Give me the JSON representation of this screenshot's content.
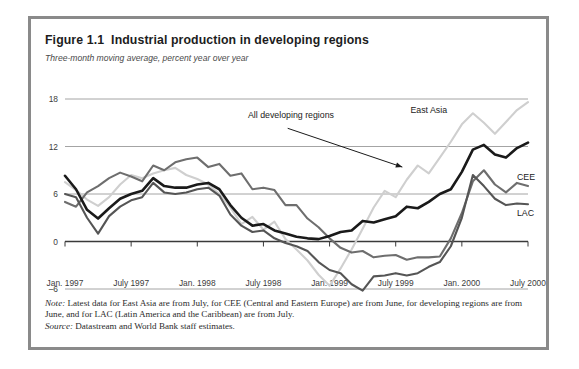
{
  "figure": {
    "title": "Figure 1.1  Industrial production in developing regions",
    "subtitle": "Three-month moving average, percent year over year",
    "note_label": "Note:",
    "note_text": " Latest data for East Asia are from July, for CEE (Central and Eastern Europe) are from June, for developing regions are from June, and for LAC (Latin America and the Caribbean) are from July.",
    "source_label": "Source:",
    "source_text": " Datastream and World Bank staff estimates."
  },
  "colors": {
    "frame": "#8a8a8a",
    "zero_axis": "#3a3a3a",
    "gridline": "#9a9a9a",
    "all_developing": "#1a1a1a",
    "east_asia": "#cfcfcf",
    "cee": "#6e6e6e",
    "lac": "#555555",
    "leader": "#1a1a1a"
  },
  "chart_data": {
    "type": "line",
    "title": "Industrial production in developing regions",
    "subtitle": "Three-month moving average, percent year over year",
    "xlabel": "",
    "ylabel": "percent year over year",
    "ylim": [
      -6,
      18
    ],
    "yticks": [
      -6,
      0,
      6,
      12,
      18
    ],
    "ytick_labels": [
      "–6",
      "0",
      "6",
      "12",
      "18"
    ],
    "xlim": [
      0,
      42
    ],
    "xticks": [
      0,
      6,
      12,
      18,
      24,
      30,
      36,
      42
    ],
    "xtick_labels": [
      "Jan. 1997",
      "July 1997",
      "Jan. 1998",
      "July 1998",
      "Jan. 1999",
      "July 1999",
      "Jan. 2000",
      "July 2000"
    ],
    "grid": true,
    "legend": "inline-annotations",
    "x": [
      0,
      1,
      2,
      3,
      4,
      5,
      6,
      7,
      8,
      9,
      10,
      11,
      12,
      13,
      14,
      15,
      16,
      17,
      18,
      19,
      20,
      21,
      22,
      23,
      24,
      25,
      26,
      27,
      28,
      29,
      30,
      31,
      32,
      33,
      34,
      35,
      36,
      37,
      38,
      39,
      40,
      41,
      42
    ],
    "series": [
      {
        "name": "East Asia",
        "color": "#cfcfcf",
        "width": 2.1,
        "label_x": 33,
        "label_y": 16.2,
        "values": [
          7.5,
          6.5,
          5.3,
          4.5,
          5.6,
          7.2,
          8.4,
          8.0,
          8.6,
          9.0,
          9.3,
          8.4,
          7.9,
          7.2,
          6.0,
          4.3,
          2.2,
          3.1,
          1.5,
          2.5,
          0.3,
          -1.0,
          -2.4,
          -4.2,
          -5.6,
          -3.4,
          -1.0,
          1.6,
          4.3,
          6.4,
          5.6,
          7.8,
          9.6,
          8.6,
          10.6,
          12.6,
          14.8,
          16.2,
          15.0,
          13.6,
          15.1,
          16.6,
          17.6
        ]
      },
      {
        "name": "All developing regions",
        "color": "#1a1a1a",
        "width": 2.6,
        "label_x": 20.5,
        "label_y": 15.6,
        "values": [
          8.3,
          6.6,
          4.0,
          2.9,
          4.2,
          5.4,
          6.0,
          6.4,
          8.0,
          7.0,
          6.8,
          6.8,
          7.2,
          7.4,
          6.6,
          4.6,
          3.0,
          2.0,
          2.2,
          1.4,
          1.0,
          0.6,
          0.4,
          0.3,
          0.7,
          1.2,
          1.4,
          2.6,
          2.4,
          2.8,
          3.2,
          4.4,
          4.2,
          5.0,
          6.0,
          6.6,
          8.8,
          11.6,
          12.2,
          11.0,
          10.6,
          11.8,
          12.5
        ]
      },
      {
        "name": "CEE",
        "color": "#6e6e6e",
        "width": 2.1,
        "label_x": 41,
        "label_y": 7.8,
        "values": [
          5.0,
          4.4,
          6.2,
          7.0,
          8.0,
          8.7,
          8.2,
          7.6,
          9.6,
          9.0,
          10.0,
          10.4,
          10.6,
          9.4,
          9.8,
          8.3,
          8.6,
          6.6,
          6.8,
          6.5,
          4.6,
          4.6,
          2.9,
          1.8,
          0.4,
          -0.8,
          -1.4,
          -1.2,
          -2.0,
          -1.8,
          -1.7,
          -2.3,
          -2.0,
          -2.0,
          -1.9,
          0.4,
          3.6,
          7.6,
          9.0,
          7.2,
          6.2,
          7.4,
          7.0
        ]
      },
      {
        "name": "LAC",
        "color": "#555555",
        "width": 2.1,
        "label_x": 41,
        "label_y": 3.2,
        "values": [
          6.0,
          5.6,
          3.0,
          1.0,
          3.2,
          4.4,
          5.2,
          5.6,
          7.4,
          6.2,
          6.0,
          6.2,
          6.6,
          6.8,
          5.8,
          3.4,
          2.0,
          1.2,
          1.4,
          0.4,
          -0.2,
          -0.6,
          -1.2,
          -2.6,
          -3.6,
          -4.0,
          -5.4,
          -6.2,
          -4.4,
          -4.3,
          -4.0,
          -4.3,
          -4.0,
          -3.2,
          -2.6,
          -0.6,
          3.0,
          8.4,
          7.0,
          5.4,
          4.6,
          4.8,
          4.7
        ]
      }
    ],
    "annotations": [
      {
        "text": "All developing regions",
        "leader_from": [
          20.2,
          14.3
        ],
        "leader_to": [
          30.6,
          9.4
        ]
      }
    ]
  }
}
